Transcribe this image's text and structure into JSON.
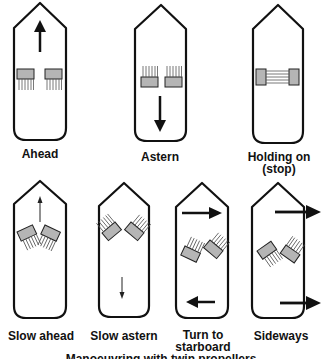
{
  "diagram": {
    "caption": "Manoeuvring with twin propellers",
    "colors": {
      "hull_outline": "#111111",
      "propeller_fill": "#b5b5b5",
      "arrow": "#111111",
      "thrust_lines": "#555555"
    },
    "panels": [
      {
        "id": "ahead",
        "label": "Ahead",
        "arrows": [
          "up-large"
        ]
      },
      {
        "id": "astern",
        "label": "Astern",
        "arrows": [
          "down-large"
        ]
      },
      {
        "id": "holding",
        "label": "Holding on",
        "label2": "(stop)",
        "arrows": []
      },
      {
        "id": "slow-ahead",
        "label": "Slow ahead",
        "arrows": [
          "up-thin"
        ]
      },
      {
        "id": "slow-astern",
        "label": "Slow astern",
        "arrows": [
          "down-thin"
        ]
      },
      {
        "id": "turn-starboard",
        "label": "Turn to",
        "label2": "starboard",
        "arrows": [
          "right-top",
          "left-bottom"
        ]
      },
      {
        "id": "sideways",
        "label": "Sideways",
        "arrows": [
          "right-top",
          "right-bottom"
        ]
      }
    ]
  }
}
